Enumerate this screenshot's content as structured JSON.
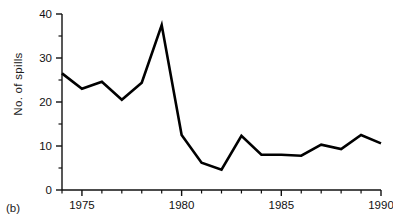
{
  "panel": {
    "label": "(b)"
  },
  "chart_data": {
    "type": "line",
    "title": "",
    "subtitle": "",
    "xlabel": "",
    "ylabel": "No. of spills",
    "xlim": [
      1974,
      1990
    ],
    "ylim": [
      0,
      40
    ],
    "grid": false,
    "legend": null,
    "x_major_ticks": [
      1975,
      1980,
      1985,
      1990
    ],
    "x_major_tick_labels": [
      "1975",
      "1980",
      "1985",
      "1990"
    ],
    "x_minor_ticks": [
      1974,
      1976,
      1977,
      1978,
      1979,
      1981,
      1982,
      1983,
      1984,
      1986,
      1987,
      1988,
      1989
    ],
    "y_major_ticks": [
      0,
      10,
      20,
      30,
      40
    ],
    "y_major_tick_labels": [
      "0",
      "10",
      "20",
      "30",
      "40"
    ],
    "y_minor_ticks": [
      5,
      15,
      25,
      35
    ],
    "line_color": "#000000",
    "line_width": 2.6,
    "x": [
      1974,
      1975,
      1976,
      1977,
      1978,
      1979,
      1980,
      1981,
      1982,
      1983,
      1984,
      1985,
      1986,
      1987,
      1988,
      1989,
      1990
    ],
    "values": [
      26.5,
      23.0,
      24.6,
      20.5,
      24.4,
      37.5,
      12.5,
      6.2,
      4.6,
      12.3,
      8.0,
      8.0,
      7.8,
      10.3,
      9.3,
      12.5,
      10.6
    ],
    "series": [
      {
        "name": "No. of spills",
        "values": [
          26.5,
          23.0,
          24.6,
          20.5,
          24.4,
          37.5,
          12.5,
          6.2,
          4.6,
          12.3,
          8.0,
          8.0,
          7.8,
          10.3,
          9.3,
          12.5,
          10.6
        ]
      }
    ]
  }
}
